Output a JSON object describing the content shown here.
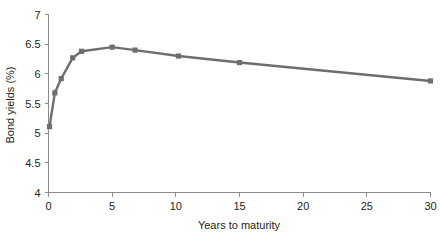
{
  "chart_data": {
    "type": "line",
    "title": "",
    "xlabel": "Years to maturity",
    "ylabel": "Bond yields (%)",
    "xlim": [
      0,
      30
    ],
    "ylim": [
      4,
      7
    ],
    "xticks": [
      0,
      5,
      10,
      15,
      20,
      25,
      30
    ],
    "xtick_labels": [
      "0",
      "5",
      "10",
      "15",
      "20",
      "25",
      "30"
    ],
    "yticks": [
      4,
      4.5,
      5,
      5.5,
      6,
      6.5,
      7
    ],
    "ytick_labels": [
      "4",
      "4.5",
      "5",
      "5.5",
      "6",
      "6.5",
      "7"
    ],
    "grid": false,
    "legend": null,
    "series": [
      {
        "name": "Bond yield curve",
        "color": "#6e6e70",
        "marker": "square",
        "x": [
          0.08,
          0.5,
          1.0,
          1.9,
          2.6,
          5.0,
          6.8,
          10.2,
          15.0,
          30.0
        ],
        "y": [
          5.11,
          5.68,
          5.92,
          6.27,
          6.38,
          6.45,
          6.4,
          6.3,
          6.19,
          5.88
        ]
      }
    ]
  },
  "axis": {
    "x_label": "Years to maturity",
    "y_label": "Bond yields (%)"
  }
}
